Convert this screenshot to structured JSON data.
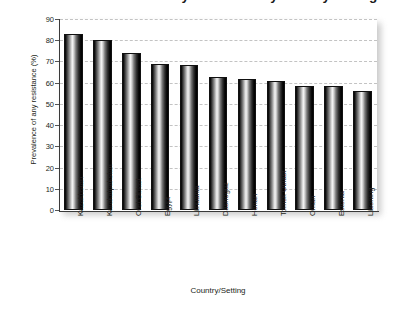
{
  "chart_data": {
    "type": "bar",
    "title": "Prevalence of any resistance by country/setting",
    "xlabel": "Country/Setting",
    "ylabel": "Prevalence of any resistance (%)",
    "categories": [
      "Kazakhstan",
      "Karakalpakstan",
      "Orel Oblast",
      "Egypt",
      "Lithuania",
      "Dashoguz",
      "Henan",
      "Tomsk Oblast",
      "Oman",
      "Estonia",
      "Liaoning"
    ],
    "values": [
      83,
      80,
      74,
      69,
      68.5,
      62.5,
      61.5,
      61,
      58.5,
      58.5,
      56
    ],
    "ylim": [
      0,
      90
    ],
    "yticks": [
      0,
      10,
      20,
      30,
      40,
      50,
      60,
      70,
      80,
      90
    ],
    "ytick_labels": [
      "0",
      "10",
      "20",
      "30",
      "40",
      "50",
      "60",
      "70",
      "80",
      "90"
    ],
    "grid": true,
    "grid_axis": "y",
    "grid_style": "dashed",
    "legend": false,
    "bar_color": "#000000",
    "bar_style": "grayscale-cylinder-gradient",
    "grid_color": "#c3c3c3",
    "axis_color": "#3a3a3a",
    "text_color": "#231f20",
    "background": "#ffffff"
  }
}
